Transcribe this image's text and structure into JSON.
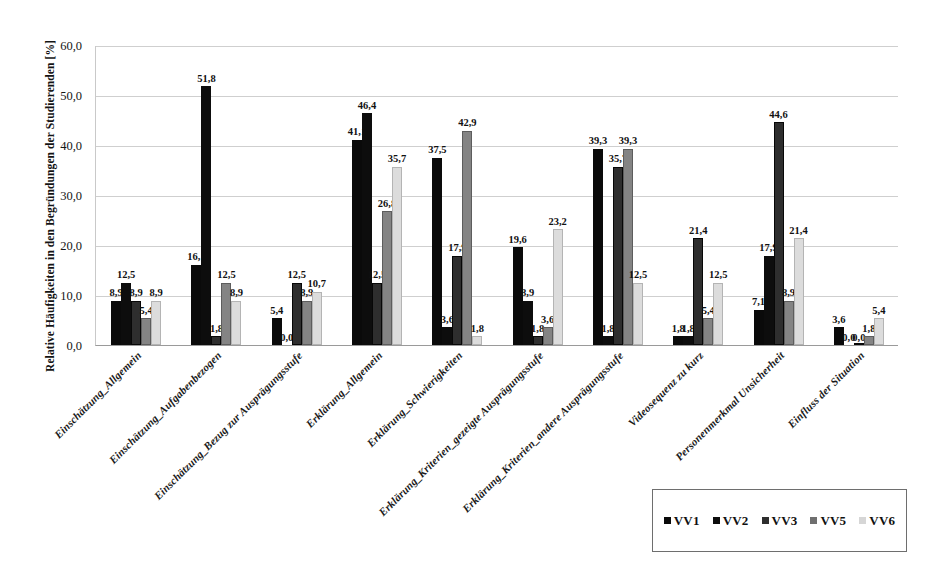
{
  "chart_data": {
    "type": "bar",
    "title": "",
    "subtitle": "",
    "xlabel": "",
    "ylabel": "Relative Häufigkeiten in den Begründungen der Studierenden [%]",
    "ylim": [
      0,
      60
    ],
    "ytick_step": 10,
    "ytick_labels": [
      "0,0",
      "10,0",
      "20,0",
      "30,0",
      "40,0",
      "50,0",
      "60,0"
    ],
    "ytick_values": [
      0,
      10,
      20,
      30,
      40,
      50,
      60
    ],
    "grid": "horizontal",
    "legend_position": "bottom-right",
    "decimal_separator": ",",
    "categories": [
      "Einschätzung_Allgemein",
      "Einschätzung_Aufgabenbezogen",
      "Einschätzung_Bezug zur Ausprägungsstufe",
      "Erklärung_Allgemein",
      "Erklärung_Schwierigkeiten",
      "Erklärung_Kriterien_gezeigte Ausprägungsstufe",
      "Erklärung_Kriterien_andere Ausprägungsstufe",
      "Videosequenz zu kurz",
      "Personenmerkmal Unsicherheit",
      "Einfluss der Situation"
    ],
    "series": [
      {
        "name": "VV1",
        "color": "#0a0a0a",
        "values": [
          8.9,
          16.1,
          5.4,
          41.1,
          37.5,
          19.6,
          39.3,
          1.8,
          7.1,
          3.6
        ],
        "labels": [
          "8,9",
          "16,1",
          "5,4",
          "41,1",
          "37,5",
          "19,6",
          "39,3",
          "1,8",
          "7,1",
          "3,6"
        ]
      },
      {
        "name": "VV2",
        "color": "#0d0d0d",
        "values": [
          12.5,
          51.8,
          0.0,
          46.4,
          3.6,
          8.9,
          1.8,
          1.8,
          17.9,
          0.0
        ],
        "labels": [
          "12,5",
          "51,8",
          "0,0",
          "46,4",
          "3,6",
          "8,9",
          "1,8",
          "1,8",
          "17,9",
          "0,0"
        ]
      },
      {
        "name": "VV3",
        "color": "#2e2e2e",
        "values": [
          8.9,
          1.8,
          12.5,
          12.5,
          17.9,
          1.8,
          35.7,
          21.4,
          44.6,
          0.0
        ],
        "labels": [
          "8,9",
          "1,8",
          "12,5",
          "12,5",
          "17,9",
          "1,8",
          "35,7",
          "21,4",
          "44,6",
          "0,0"
        ]
      },
      {
        "name": "VV5",
        "color": "#848484",
        "values": [
          5.4,
          12.5,
          8.9,
          26.8,
          42.9,
          3.6,
          39.3,
          5.4,
          8.9,
          1.8
        ],
        "labels": [
          "5,4",
          "12,5",
          "8,9",
          "26,8",
          "42,9",
          "3,6",
          "39,3",
          "5,4",
          "8,9",
          "1,8"
        ]
      },
      {
        "name": "VV6",
        "color": "#dcdcdc",
        "values": [
          8.9,
          8.9,
          10.7,
          35.7,
          1.8,
          23.2,
          12.5,
          12.5,
          21.4,
          5.4
        ],
        "labels": [
          "8,9",
          "8,9",
          "10,7",
          "35,7",
          "1,8",
          "23,2",
          "12,5",
          "12,5",
          "21,4",
          "5,4"
        ]
      }
    ]
  },
  "legend": {
    "items": [
      {
        "label": "VV1"
      },
      {
        "label": "VV2"
      },
      {
        "label": "VV3"
      },
      {
        "label": "VV5"
      },
      {
        "label": "VV6"
      }
    ]
  }
}
